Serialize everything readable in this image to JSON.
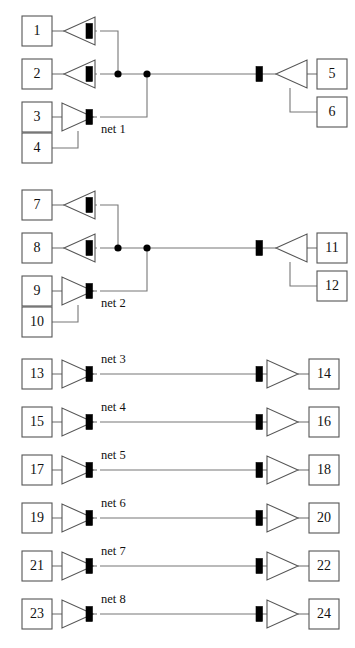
{
  "diagram": {
    "colors": {
      "background": "#ffffff",
      "box_stroke": "#555555",
      "wire": "#777777",
      "port_fill": "#000000",
      "text": "#111111"
    },
    "nets": [
      {
        "id": "net-1",
        "label": "net 1",
        "kind": "multi-driver",
        "driver_cells": [
          "1",
          "2",
          "3"
        ],
        "driver_extra_cells": [
          "4"
        ],
        "receiver_cells": [
          "5"
        ],
        "receiver_extra_cells": [
          "6"
        ],
        "junction_count": 2
      },
      {
        "id": "net-2",
        "label": "net 2",
        "kind": "multi-driver",
        "driver_cells": [
          "7",
          "8",
          "9"
        ],
        "driver_extra_cells": [
          "10"
        ],
        "receiver_cells": [
          "11"
        ],
        "receiver_extra_cells": [
          "12"
        ],
        "junction_count": 2
      },
      {
        "id": "net-3",
        "label": "net 3",
        "kind": "point-to-point",
        "source_cell": "13",
        "sink_cell": "14"
      },
      {
        "id": "net-4",
        "label": "net 4",
        "kind": "point-to-point",
        "source_cell": "15",
        "sink_cell": "16"
      },
      {
        "id": "net-5",
        "label": "net 5",
        "kind": "point-to-point",
        "source_cell": "17",
        "sink_cell": "18"
      },
      {
        "id": "net-6",
        "label": "net 6",
        "kind": "point-to-point",
        "source_cell": "19",
        "sink_cell": "20"
      },
      {
        "id": "net-7",
        "label": "net 7",
        "kind": "point-to-point",
        "source_cell": "21",
        "sink_cell": "22"
      },
      {
        "id": "net-8",
        "label": "net 8",
        "kind": "point-to-point",
        "source_cell": "23",
        "sink_cell": "24"
      }
    ],
    "cells": {
      "c1": "1",
      "c2": "2",
      "c3": "3",
      "c4": "4",
      "c5": "5",
      "c6": "6",
      "c7": "7",
      "c8": "8",
      "c9": "9",
      "c10": "10",
      "c11": "11",
      "c12": "12",
      "c13": "13",
      "c14": "14",
      "c15": "15",
      "c16": "16",
      "c17": "17",
      "c18": "18",
      "c19": "19",
      "c20": "20",
      "c21": "21",
      "c22": "22",
      "c23": "23",
      "c24": "24"
    },
    "net_labels": {
      "n1": "net 1",
      "n2": "net 2",
      "n3": "net 3",
      "n4": "net 4",
      "n5": "net 5",
      "n6": "net 6",
      "n7": "net 7",
      "n8": "net 8"
    }
  }
}
